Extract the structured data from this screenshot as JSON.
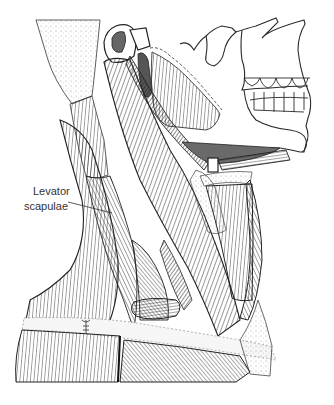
{
  "figure": {
    "background": "#ffffff",
    "ink_color": "#2a2a2a"
  },
  "labels": [
    {
      "line1": "Levator",
      "line2": "scapulae",
      "leader_from": [
        68,
        202
      ],
      "leader_to": [
        112,
        213
      ]
    }
  ]
}
